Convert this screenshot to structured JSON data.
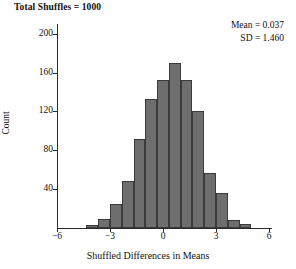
{
  "title": "Total Shuffles = 1000",
  "stats": {
    "mean_line": "Mean = 0.037",
    "sd_line": "SD = 1.460"
  },
  "chart_data": {
    "type": "bar",
    "title": "Total Shuffles = 1000",
    "xlabel": "Shuffled Differences in Means",
    "ylabel": "Count",
    "xlim": [
      -6,
      6
    ],
    "ylim": [
      0,
      210
    ],
    "xticks": [
      -6,
      -3,
      0,
      3,
      6
    ],
    "xtick_labels": [
      "−6",
      "−3",
      "0",
      "3",
      "6"
    ],
    "yticks": [
      40,
      80,
      120,
      160,
      200
    ],
    "ytick_labels": [
      "40",
      "80",
      "120",
      "160",
      "200"
    ],
    "grid": false,
    "legend": "none",
    "bar_color": "#6e6e6e",
    "bar_edge_color": "#3b3b3b",
    "bin_width": 0.6667,
    "annotations": [
      "Mean = 0.037",
      "SD = 1.460"
    ],
    "summary": {
      "mean": 0.037,
      "sd": 1.46,
      "total_shuffles": 1000
    },
    "bins": [
      {
        "left": -4.333,
        "right": -3.667,
        "count": 3
      },
      {
        "left": -3.667,
        "right": -3.0,
        "count": 9
      },
      {
        "left": -3.0,
        "right": -2.333,
        "count": 25
      },
      {
        "left": -2.333,
        "right": -1.667,
        "count": 48
      },
      {
        "left": -1.667,
        "right": -1.0,
        "count": 92
      },
      {
        "left": -1.0,
        "right": -0.333,
        "count": 133
      },
      {
        "left": -0.333,
        "right": 0.333,
        "count": 152
      },
      {
        "left": 0.333,
        "right": 1.0,
        "count": 170
      },
      {
        "left": 1.0,
        "right": 1.667,
        "count": 152
      },
      {
        "left": 1.667,
        "right": 2.333,
        "count": 120
      },
      {
        "left": 2.333,
        "right": 3.0,
        "count": 57
      },
      {
        "left": 3.0,
        "right": 3.667,
        "count": 36
      },
      {
        "left": 3.667,
        "right": 4.333,
        "count": 8
      },
      {
        "left": 4.333,
        "right": 5.0,
        "count": 4
      }
    ]
  }
}
